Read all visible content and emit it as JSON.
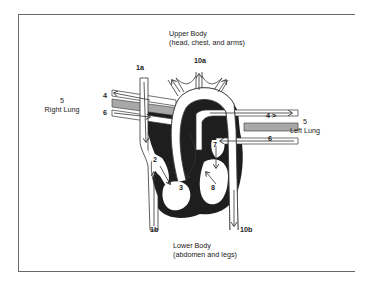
{
  "diagram": {
    "type": "heart-circulation-diagram",
    "regions": {
      "upper_body": {
        "title": "Upper Body",
        "subtitle": "(head, chest, and arms)"
      },
      "lower_body": {
        "title": "Lower Body",
        "subtitle": "(abdomen and legs)"
      },
      "right_lung": {
        "number": "5",
        "label": "Right Lung"
      },
      "left_lung": {
        "number": "5",
        "label": "Left Lung"
      }
    },
    "labels": {
      "l1a": "1a",
      "l1b": "1b",
      "l2": "2",
      "l3": "3",
      "l4_left": "4",
      "l4_right": "4 >",
      "l6_left": "6",
      "l6_right": "6",
      "l7": "7",
      "l8": "8",
      "l9": "9",
      "l10a": "10a",
      "l10b": "10b"
    },
    "colors": {
      "frame": "#6a6a6a",
      "heart_fill": "#1e1e1e",
      "vessel_fill": "#ffffff",
      "vessel_stroke": "#333333",
      "pulmonary_band": "#a8a8a8"
    }
  }
}
